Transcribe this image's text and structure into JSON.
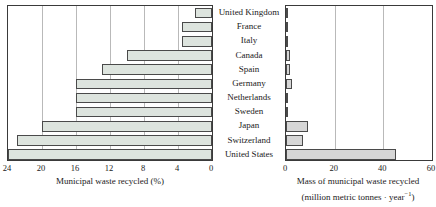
{
  "chart_data": {
    "type": "bar",
    "orientation": "horizontal",
    "title": "",
    "categories": [
      "United Kingdom",
      "France",
      "Italy",
      "Canada",
      "Spain",
      "Germany",
      "Netherlands",
      "Sweden",
      "Japan",
      "Switzerland",
      "United States"
    ],
    "panels": [
      {
        "id": "left",
        "xlabel": "Municipal waste recycled (%)",
        "ylabel": "",
        "xlim": [
          24,
          0
        ],
        "reversed": true,
        "ticks": [
          24,
          20,
          16,
          12,
          8,
          4,
          0
        ],
        "tick_labels": [
          "24",
          "20",
          "16",
          "12",
          "8",
          "4",
          "0"
        ],
        "grid": true,
        "bar_fill": "#dde4de",
        "bar_edge": "#4a4a4a",
        "values": [
          2.0,
          3.5,
          3.5,
          10.0,
          13.0,
          16.0,
          16.0,
          16.0,
          20.0,
          23.0,
          24.0
        ]
      },
      {
        "id": "right",
        "xlabel": "Mass of municipal waste recycled",
        "xlabel_line2_prefix": "(million metric tonnes · year",
        "xlabel_line2_sup": "−1",
        "xlabel_line2_suffix": ")",
        "ylabel": "",
        "xlim": [
          0,
          60
        ],
        "reversed": false,
        "ticks": [
          0,
          20,
          40,
          60
        ],
        "tick_labels": [
          "0",
          "20",
          "40",
          "60"
        ],
        "grid": true,
        "bar_fill": "#d6d6d6",
        "bar_edge": "#4a4a4a",
        "values": [
          0.7,
          0.8,
          0.8,
          1.6,
          1.6,
          2.3,
          0.8,
          0.5,
          9.0,
          7.0,
          45.0
        ]
      }
    ]
  }
}
